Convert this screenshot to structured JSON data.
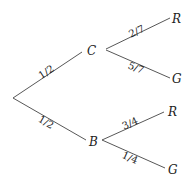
{
  "diagram": {
    "type": "probability-tree",
    "root": {
      "branches": [
        {
          "node": "C",
          "probability": "1/2",
          "children": [
            {
              "node": "R",
              "probability": "2/7"
            },
            {
              "node": "G",
              "probability": "5/7"
            }
          ]
        },
        {
          "node": "B",
          "probability": "1/2",
          "children": [
            {
              "node": "R",
              "probability": "3/4"
            },
            {
              "node": "G",
              "probability": "1/4"
            }
          ]
        }
      ]
    }
  }
}
